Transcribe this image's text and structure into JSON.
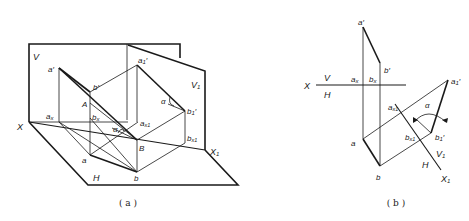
{
  "figure_a": {
    "caption": "( a )",
    "labels": {
      "V": "V",
      "V1": "V",
      "V1_sub": "1",
      "H": "H",
      "X": "X",
      "X1": "X",
      "X1_sub": "1",
      "a_prime": "a′",
      "ax": "a",
      "ax_sub": "x",
      "a": "a",
      "b_prime": "b′",
      "bx": "b",
      "bx_sub": "x",
      "b": "b",
      "A": "A",
      "B": "B",
      "a1_prime": "a",
      "a1_prime_sub": "1",
      "a1_prime_mark": "′",
      "b1_prime": "b",
      "b1_prime_sub": "1",
      "b1_prime_mark": "′",
      "ax1": "a",
      "ax1_sub": "x1",
      "bx1": "b",
      "bx1_sub": "x1",
      "alpha_1": "α",
      "alpha_2": "α"
    }
  },
  "figure_b": {
    "caption": "( b )",
    "labels": {
      "X": "X",
      "V": "V",
      "H": "H",
      "a_prime": "a′",
      "ax": "a",
      "ax_sub": "x",
      "a": "a",
      "b_prime": "b′",
      "bx": "b",
      "bx_sub": "x",
      "b": "b",
      "a1_prime": "a",
      "a1_prime_sub": "1",
      "a1_prime_mark": "′",
      "b1_prime": "b",
      "b1_prime_sub": "1",
      "b1_prime_mark": "′",
      "ax1": "a",
      "ax1_sub": "x1",
      "bx1": "b",
      "bx1_sub": "x1",
      "V1": "V",
      "V1_sub": "1",
      "H2": "H",
      "X1": "X",
      "X1_sub": "1",
      "alpha": "α"
    }
  }
}
